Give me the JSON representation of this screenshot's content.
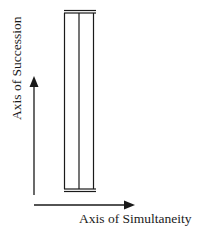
{
  "diagram": {
    "vertical_axis_label": "Axis of Succession",
    "horizontal_axis_label": "Axis of Simultaneity",
    "column": {
      "description": "Tall narrow rectangle divided vertically into two columns, capped with double lines at top and bottom",
      "divisions": 2
    },
    "colors": {
      "stroke": "#1a1a1a",
      "background": "#ffffff"
    }
  }
}
